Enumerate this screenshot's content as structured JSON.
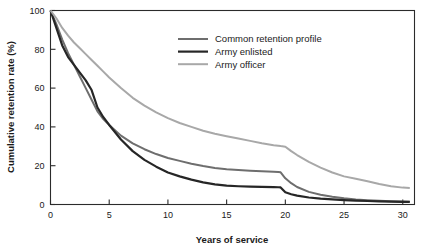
{
  "chart_data": {
    "type": "line",
    "title": "",
    "xlabel": "Years of service",
    "ylabel": "Cumulative retention rate (%)",
    "xlim": [
      0,
      31
    ],
    "ylim": [
      0,
      100
    ],
    "xticks": [
      0,
      5,
      10,
      15,
      20,
      25,
      30
    ],
    "yticks": [
      0,
      20,
      40,
      60,
      80,
      100
    ],
    "xtick_labels": [
      "0",
      "5",
      "10",
      "15",
      "20",
      "25",
      "30"
    ],
    "ytick_labels": [
      "0",
      "20",
      "40",
      "60",
      "80",
      "100"
    ],
    "grid": false,
    "legend_position": "upper-center",
    "x": [
      0,
      0.5,
      1,
      1.5,
      2,
      2.5,
      3,
      3.5,
      4,
      4.5,
      5,
      6,
      7,
      8,
      9,
      10,
      11,
      12,
      13,
      14,
      15,
      16,
      17,
      18,
      19,
      19.4,
      19.6,
      20,
      20.5,
      21,
      22,
      23,
      24,
      25,
      26,
      27,
      28,
      29,
      30,
      30.6
    ],
    "series": [
      {
        "name": "Common retention profile",
        "color": "#6e6e6e",
        "width": 2.0,
        "values": [
          100,
          93,
          85,
          78,
          72,
          66,
          60,
          54,
          48,
          44,
          41,
          35.5,
          31.5,
          28.5,
          26,
          24,
          22.5,
          21,
          19.8,
          18.8,
          18.2,
          17.8,
          17.4,
          17.1,
          16.9,
          16.8,
          16.6,
          13.5,
          11,
          9,
          6.5,
          5,
          4,
          3.2,
          2.6,
          2.2,
          1.9,
          1.7,
          1.6,
          1.5
        ]
      },
      {
        "name": "Army enlisted",
        "color": "#262626",
        "width": 2.2,
        "values": [
          100,
          91,
          82,
          76,
          72,
          68,
          64,
          59,
          50,
          45,
          41,
          33.5,
          27.5,
          23,
          19.5,
          16.5,
          14.5,
          12.8,
          11.4,
          10.4,
          9.7,
          9.4,
          9.2,
          9.1,
          9.0,
          8.9,
          8.8,
          6.3,
          5.3,
          4.6,
          3.6,
          3.0,
          2.6,
          2.3,
          2.0,
          1.8,
          1.6,
          1.5,
          1.4,
          1.3
        ]
      },
      {
        "name": "Army officer",
        "color": "#a8a8a8",
        "width": 2.0,
        "values": [
          100,
          96,
          91,
          87,
          83.5,
          80.5,
          77.5,
          74.5,
          71.5,
          68.5,
          65.5,
          60,
          55,
          51,
          47.5,
          44.5,
          42,
          40,
          38,
          36.5,
          35.2,
          34,
          32.8,
          31.6,
          30.6,
          30.3,
          30.1,
          29.8,
          27.5,
          25.5,
          22,
          19,
          16.5,
          14.5,
          13.3,
          12,
          10.6,
          9.4,
          8.7,
          8.5
        ]
      }
    ]
  },
  "legend": {
    "items": [
      {
        "label": "Common retention profile"
      },
      {
        "label": "Army enlisted"
      },
      {
        "label": "Army officer"
      }
    ]
  }
}
